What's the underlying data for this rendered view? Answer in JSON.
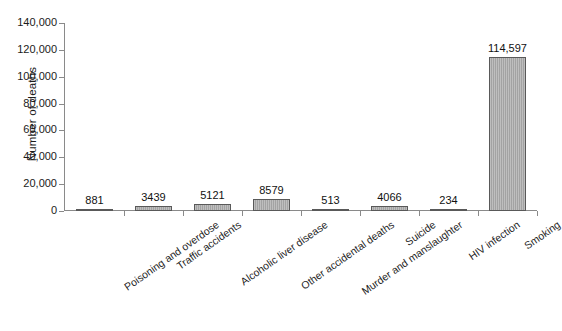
{
  "chart_data": {
    "type": "bar",
    "title": "",
    "subtitle": "",
    "xlabel": "",
    "ylabel": "Number of deaths",
    "ylim": [
      0,
      140000
    ],
    "ytick_labels": [
      "140,000",
      "120,000",
      "100,000",
      "80,000",
      "60,000",
      "40,000",
      "20,000",
      "0"
    ],
    "ytick_values": [
      140000,
      120000,
      100000,
      80000,
      60000,
      40000,
      20000,
      0
    ],
    "grid": false,
    "legend": null,
    "legend_position": "none",
    "categories": [
      "Poisoning and overdose",
      "Traffic accidents",
      "Alcoholic liver disease",
      "Other accidental deaths",
      "Murder and manslaughter",
      "Suicide",
      "HIV infection",
      "Smoking"
    ],
    "values": [
      881,
      3439,
      5121,
      8579,
      513,
      4066,
      234,
      114597
    ],
    "value_labels": [
      "881",
      "3439",
      "5121",
      "8579",
      "513",
      "4066",
      "234",
      "114,597"
    ],
    "bar_color": "#a3a3a3",
    "bar_edge_color": "#595959",
    "axis_color": "#8a8a8a",
    "text_color": "#1b1b1b",
    "background": "#ffffff"
  }
}
